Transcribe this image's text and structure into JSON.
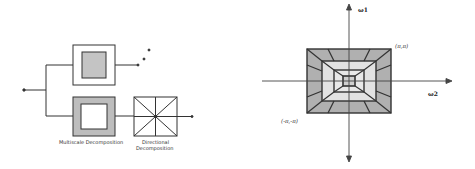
{
  "left_diagram": {
    "title": "Contourlet filter bank",
    "labels": {
      "multiscale": "Multiscale Decomposition",
      "directional_line1": "Directional",
      "directional_line2": "Decomposition"
    },
    "ellipsis": "..."
  },
  "right_diagram": {
    "title": "Frequency plane partition",
    "axis_labels": {
      "vertical": "ω1",
      "horizontal": "ω2"
    },
    "corner_labels": {
      "top_right": "(π,π)",
      "bottom_left": "(-π,-π)"
    }
  },
  "colors": {
    "stroke": "#333333",
    "dark_fill": "#b0b0b0",
    "mid_fill": "#c4c4c4",
    "light_fill": "#e2e2e2",
    "white": "#ffffff"
  }
}
